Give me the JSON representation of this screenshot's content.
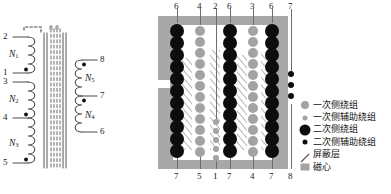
{
  "figure": {
    "title": "",
    "left_schematic": {
      "name": "transformer-winding-schematic",
      "primary_windings": [
        {
          "label": "N1",
          "base": "N",
          "sub": "1",
          "top_terminal": "2",
          "bottom_terminal": "1"
        },
        {
          "label": "N2",
          "base": "N",
          "sub": "2",
          "top_terminal": "3",
          "bottom_terminal": "4"
        },
        {
          "label": "N3",
          "base": "N",
          "sub": "3",
          "top_terminal": "4",
          "bottom_terminal": "5"
        }
      ],
      "secondary_windings": [
        {
          "label": "N5",
          "base": "N",
          "sub": "5",
          "top_terminal": "8",
          "bottom_terminal": "7"
        },
        {
          "label": "N4",
          "base": "N",
          "sub": "4",
          "top_terminal": "7",
          "bottom_terminal": "6"
        }
      ],
      "terminals_left": [
        "2",
        "1",
        "3",
        "4",
        "5"
      ],
      "terminals_right": [
        "8",
        "7",
        "6"
      ],
      "core_note": "magnetic core shown as vertical solid and dashed line bundle"
    },
    "right_diagram": {
      "name": "winding-cross-section",
      "top_labels": [
        "6",
        "4",
        "2",
        "6",
        "3",
        "6",
        "7"
      ],
      "bottom_labels": [
        "7",
        "5",
        "1",
        "7",
        "4",
        "7",
        "8"
      ],
      "columns": [
        {
          "index": 0,
          "type": "secondary",
          "size": "large",
          "top": "6",
          "bottom": "7"
        },
        {
          "index": 1,
          "type": "primary",
          "size": "large",
          "top": "4",
          "bottom": "5"
        },
        {
          "index": 2,
          "type": "primary",
          "size": "small",
          "top": "2",
          "bottom": "1"
        },
        {
          "index": 3,
          "type": "secondary",
          "size": "large",
          "top": "6",
          "bottom": "7"
        },
        {
          "index": 4,
          "type": "primary",
          "size": "large",
          "top": "3",
          "bottom": "4"
        },
        {
          "index": 5,
          "type": "secondary",
          "size": "large",
          "top": "6",
          "bottom": "7"
        },
        {
          "index": 6,
          "type": "secondary",
          "size": "small",
          "top": "7",
          "bottom": "8"
        }
      ]
    },
    "legend": {
      "name": "winding-legend",
      "items": [
        {
          "marker": "primary-winding-dot-icon",
          "text": "一次侧绕组",
          "color": "#a3a3a3"
        },
        {
          "marker": "primary-aux-winding-dot-icon",
          "text": "一次侧辅助绕组",
          "color": "#a3a3a3"
        },
        {
          "marker": "secondary-winding-dot-icon",
          "text": "二次侧绕组",
          "color": "#0d0d0d"
        },
        {
          "marker": "secondary-aux-winding-dot-icon",
          "text": "二次侧辅助绕组",
          "color": "#0d0d0d"
        },
        {
          "marker": "shield-layer-hatch-icon",
          "text": "屏蔽层",
          "color": "#555555"
        },
        {
          "marker": "magnetic-core-square-icon",
          "text": "磁心",
          "color": "#a3a3a3"
        }
      ]
    }
  }
}
